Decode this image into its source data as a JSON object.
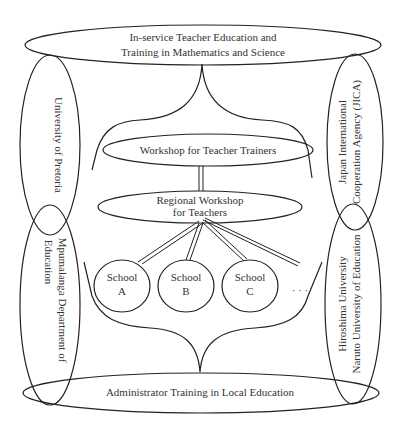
{
  "diagram": {
    "top_program": {
      "line1": "In-service Teacher Education and",
      "line2": "Training in Mathematics and Science"
    },
    "bottom_program": {
      "label": "Administrator Training in Local Education"
    },
    "left_partners": [
      {
        "line1": "University of Pretoria"
      },
      {
        "line1": "Mpumalanga Department of",
        "line2": "Education"
      }
    ],
    "right_partners": [
      {
        "line1": "Japan International",
        "line2": "Cooperation Agency (JICA)"
      },
      {
        "line1": "Hiroshima University",
        "line2": "Naruto University of Education"
      }
    ],
    "workshop_trainers": {
      "label": "Workshop for Teacher Trainers"
    },
    "workshop_regional": {
      "line1": "Regional Workshop",
      "line2": "for Teachers"
    },
    "schools": [
      {
        "line1": "School",
        "line2": "A"
      },
      {
        "line1": "School",
        "line2": "B"
      },
      {
        "line1": "School",
        "line2": "C"
      }
    ],
    "ellipsis": "· · ·",
    "colors": {
      "stroke": "#222222",
      "text": "#333333",
      "background": "#ffffff"
    }
  }
}
